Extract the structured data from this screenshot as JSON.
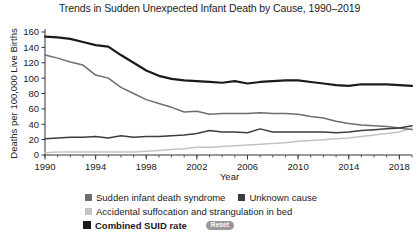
{
  "chart_data": {
    "type": "line",
    "title": "Trends in Sudden Unexpected Infant Death by Cause, 1990–2019",
    "xlabel": "Year",
    "ylabel": "Deaths per 100,000 Live Births",
    "xlim": [
      1990,
      2019
    ],
    "ylim": [
      0,
      160
    ],
    "ytick_labels": [
      "0",
      "20",
      "40",
      "60",
      "80",
      "100",
      "120",
      "140",
      "160"
    ],
    "ytick_values": [
      0,
      20,
      40,
      60,
      80,
      100,
      120,
      140,
      160
    ],
    "xtick_labels": [
      "1990",
      "1994",
      "1998",
      "2002",
      "2006",
      "2010",
      "2014",
      "2018"
    ],
    "xtick_values": [
      1990,
      1994,
      1998,
      2002,
      2006,
      2010,
      2014,
      2018
    ],
    "minor_xticks_every": 1,
    "grid": false,
    "legend_position": "bottom",
    "x": [
      1990,
      1991,
      1992,
      1993,
      1994,
      1995,
      1996,
      1997,
      1998,
      1999,
      2000,
      2001,
      2002,
      2003,
      2004,
      2005,
      2006,
      2007,
      2008,
      2009,
      2010,
      2011,
      2012,
      2013,
      2014,
      2015,
      2016,
      2017,
      2018,
      2019
    ],
    "series": [
      {
        "name": "Combined SUID rate",
        "color": "#1a1a1a",
        "width": 2.2,
        "values": [
          154,
          153,
          151,
          147,
          143,
          141,
          130,
          120,
          110,
          103,
          99,
          97,
          96,
          95,
          94,
          96,
          93,
          95,
          96,
          97,
          97,
          95,
          93,
          91,
          90,
          92,
          92,
          92,
          91,
          90
        ]
      },
      {
        "name": "Sudden infant death syndrome",
        "color": "#6e6e6e",
        "width": 1.5,
        "values": [
          130,
          126,
          121,
          117,
          104,
          100,
          88,
          80,
          72,
          67,
          62,
          56,
          57,
          53,
          54,
          54,
          54,
          55,
          54,
          54,
          53,
          50,
          48,
          44,
          41,
          39,
          38,
          37,
          35,
          33
        ]
      },
      {
        "name": "Unknown cause",
        "color": "#3d3d3d",
        "width": 1.5,
        "values": [
          21,
          22,
          23,
          23,
          24,
          22,
          25,
          23,
          24,
          24,
          25,
          26,
          28,
          32,
          30,
          30,
          29,
          34,
          30,
          30,
          30,
          30,
          30,
          29,
          30,
          32,
          33,
          34,
          35,
          38
        ]
      },
      {
        "name": "Accidental suffocation and strangulation in bed",
        "color": "#c3c3c3",
        "width": 1.5,
        "values": [
          3,
          4,
          4,
          4,
          4,
          4,
          4,
          4,
          5,
          6,
          7,
          8,
          10,
          10,
          11,
          12,
          13,
          14,
          15,
          16,
          18,
          19,
          20,
          21,
          22,
          24,
          26,
          28,
          30,
          35
        ]
      }
    ],
    "legend": [
      {
        "label": "Sudden infant death syndrome",
        "color": "#6e6e6e",
        "bold": false
      },
      {
        "label": "Unknown cause",
        "color": "#3d3d3d",
        "bold": false
      },
      {
        "label": "Accidental suffocation and strangulation in bed",
        "color": "#c3c3c3",
        "bold": false
      },
      {
        "label": "Combined SUID rate",
        "color": "#1a1a1a",
        "bold": true
      }
    ],
    "reset_button_label": "Reset"
  }
}
